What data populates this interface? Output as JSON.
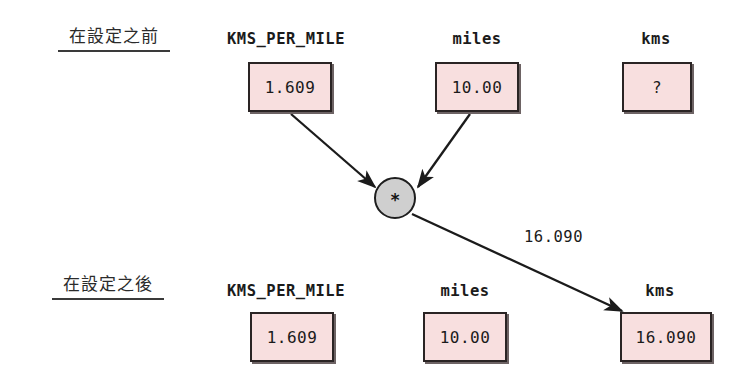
{
  "diagram": {
    "title_semantics": "variable assignment trace: kms = KMS_PER_MILE * miles",
    "colors": {
      "box_fill": "#f8dfdf",
      "box_border": "#2a2424",
      "operator_fill": "#cfcfcf",
      "operator_border": "#1e1e1e",
      "arrow": "#1b1b1b",
      "text": "#1b1b1b",
      "background": "#ffffff"
    }
  },
  "stages": {
    "before": {
      "label": "在設定之前",
      "variables": [
        {
          "name": "KMS_PER_MILE",
          "value": "1.609"
        },
        {
          "name": "miles",
          "value": "10.00"
        },
        {
          "name": "kms",
          "value": "?"
        }
      ]
    },
    "after": {
      "label": "在設定之後",
      "variables": [
        {
          "name": "KMS_PER_MILE",
          "value": "1.609"
        },
        {
          "name": "miles",
          "value": "10.00"
        },
        {
          "name": "kms",
          "value": "16.090"
        }
      ]
    }
  },
  "operator": {
    "symbol": "*",
    "name": "multiply"
  },
  "edges": {
    "result_label": "16.090"
  }
}
